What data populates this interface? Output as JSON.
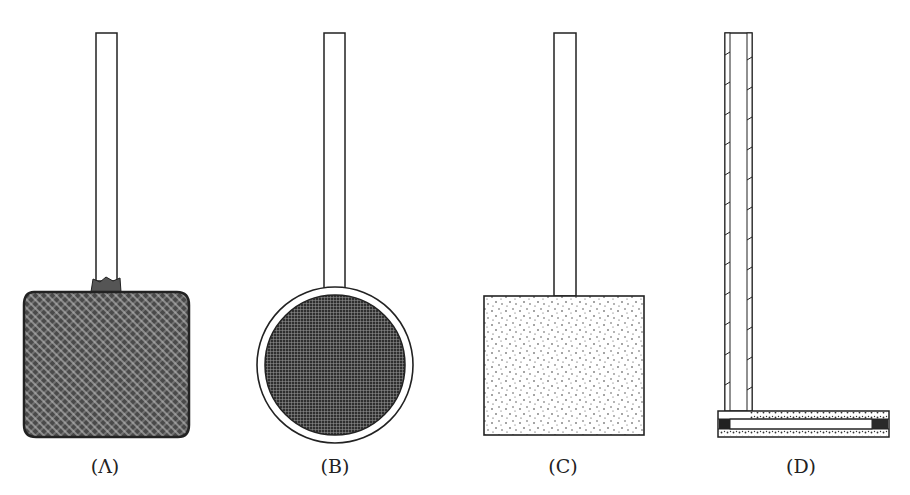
{
  "figure": {
    "panels": [
      {
        "id": "A",
        "label": "(Λ)",
        "shape": "square-mesh-bag",
        "fill": "cross-hatched"
      },
      {
        "id": "B",
        "label": "(B)",
        "shape": "circle-with-rim",
        "fill": "fine-grid"
      },
      {
        "id": "C",
        "label": "(C)",
        "shape": "square",
        "fill": "stippled"
      },
      {
        "id": "D",
        "label": "(D)",
        "shape": "L-tube-cross-section",
        "fill": "hatched-walls"
      }
    ],
    "colors": {
      "ink": "#222222",
      "paper": "#ffffff",
      "dark_fill": "#3a3a3a"
    }
  }
}
